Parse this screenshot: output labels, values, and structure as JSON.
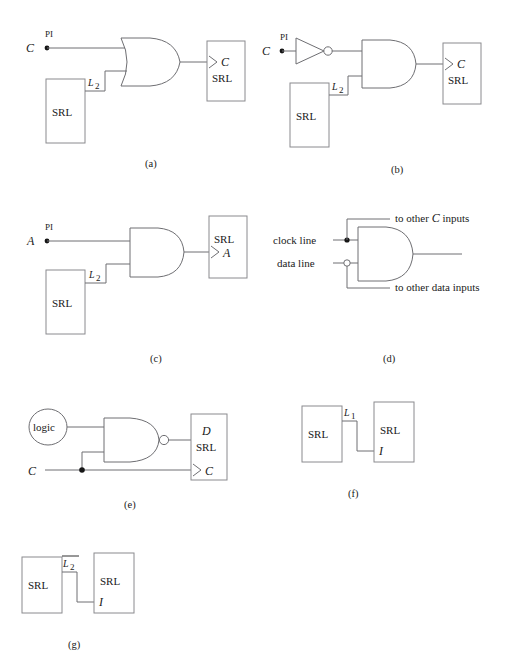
{
  "figure": {
    "title": "",
    "background": "#ffffff",
    "wire_color": "#6e6e72",
    "box_color": "#8a8a8e",
    "text_color": "#1a1a1a"
  },
  "panels": [
    {
      "id": "a",
      "caption": "(a)",
      "description": "OR gate driving a C SRL, with PI input C and SRL L2 feedback",
      "gate_type": "OR",
      "input_signal": "C",
      "input_source": "PI",
      "feedback_label": "L_2",
      "feedback_label_base": "L",
      "feedback_label_sub": "2",
      "source_block": "SRL",
      "dest_block_line1": "C",
      "dest_block_line2": "SRL",
      "dest_has_clock_arrow": true
    },
    {
      "id": "b",
      "caption": "(b)",
      "description": "Inverter then AND gate driving a C SRL, with PI input C and SRL L2 feedback",
      "gate_type": "AND",
      "has_inverter": true,
      "input_signal": "C",
      "input_source": "PI",
      "feedback_label_base": "L",
      "feedback_label_sub": "2",
      "source_block": "SRL",
      "dest_block_line1": "C",
      "dest_block_line2": "SRL",
      "dest_has_clock_arrow": true
    },
    {
      "id": "c",
      "caption": "(c)",
      "description": "AND gate driving an SRL A input, with PI input A and SRL L2 feedback",
      "gate_type": "AND",
      "input_signal": "A",
      "input_source": "PI",
      "feedback_label_base": "L",
      "feedback_label_sub": "2",
      "source_block": "SRL",
      "dest_block_line1": "SRL",
      "dest_block_line2": "A",
      "dest_has_clock_arrow": true
    },
    {
      "id": "d",
      "caption": "(d)",
      "description": "AND gate gating a clock line and data line with fanout to other inputs",
      "gate_type": "AND",
      "input_label_top": "clock line",
      "input_label_bottom": "data line",
      "branch_label_top": "to other C inputs",
      "branch_label_top_pre": "to other ",
      "branch_label_top_ital": "C",
      "branch_label_top_post": " inputs",
      "branch_label_bottom": "to other data inputs",
      "top_junction": "filled-dot",
      "bottom_junction": "open-circle"
    },
    {
      "id": "e",
      "caption": "(e)",
      "description": "Logic cloud and C into a NAND gate driving D of a D SRL; C also drives the SRL clock",
      "gate_type": "NAND",
      "cloud_label": "logic",
      "input_signal": "C",
      "dest_block_line1": "D",
      "dest_block_line2": "SRL",
      "dest_block_line3": "C",
      "dest_has_clock_arrow": true,
      "junction": "filled-dot"
    },
    {
      "id": "f",
      "caption": "(f)",
      "description": "SRL L1 output connected to the I input of another SRL",
      "left_block": "SRL",
      "right_block_line1": "SRL",
      "right_block_line2": "I",
      "net_label_base": "L",
      "net_label_sub": "1",
      "net_label_overline": false
    },
    {
      "id": "g",
      "caption": "(g)",
      "description": "SRL L2-bar output connected to the I input of another SRL",
      "left_block": "SRL",
      "right_block_line1": "SRL",
      "right_block_line2": "I",
      "net_label_base": "L",
      "net_label_sub": "2",
      "net_label_overline": true
    }
  ],
  "labels": {
    "pi": "PI",
    "srl": "SRL",
    "logic": "logic",
    "clock_line": "clock line",
    "data_line": "data line",
    "to_other_c_inputs_pre": "to other ",
    "to_other_c_inputs_ital": "C",
    "to_other_c_inputs_post": " inputs",
    "to_other_data_inputs": "to other data inputs",
    "sig_c": "C",
    "sig_a": "A",
    "sig_d": "D",
    "sig_i": "I",
    "sub_1": "1",
    "sub_2": "2",
    "l": "L",
    "cap_a": "(a)",
    "cap_b": "(b)",
    "cap_c": "(c)",
    "cap_d": "(d)",
    "cap_e": "(e)",
    "cap_f": "(f)",
    "cap_g": "(g)"
  }
}
